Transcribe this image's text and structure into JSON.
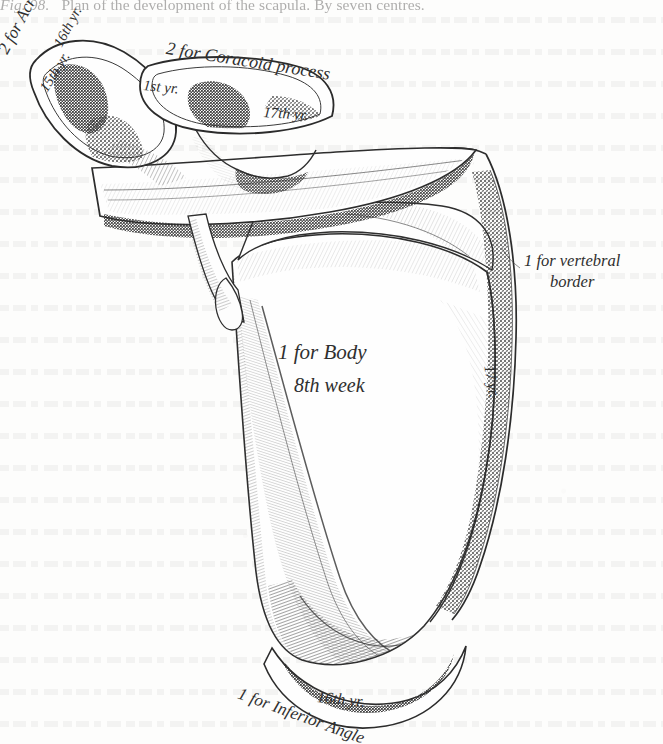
{
  "plate": {
    "caption_figure": "Fig. 98.",
    "caption_text": "Plan of the development of the scapula.  By seven centres.",
    "subject": "scapula",
    "ink_color": "#2f2f2f",
    "paper_color": "#fdfdfc"
  },
  "labels": {
    "acromion": {
      "text": "2 for Acromion process",
      "centre_upper": "16th yr.",
      "centre_lower": "15th yr."
    },
    "coracoid": {
      "text": "2 for Coracoid process",
      "centre_upper": "1st yr.",
      "centre_lower": "17th yr."
    },
    "vertebral_border": {
      "line1": "1 for vertebral",
      "line2": "border",
      "centre": "17 yr."
    },
    "body": {
      "line1": "1 for Body",
      "line2": "8th week"
    },
    "inferior_angle": {
      "text": "1 for Inferior Angle",
      "centre": "16th yr."
    }
  }
}
